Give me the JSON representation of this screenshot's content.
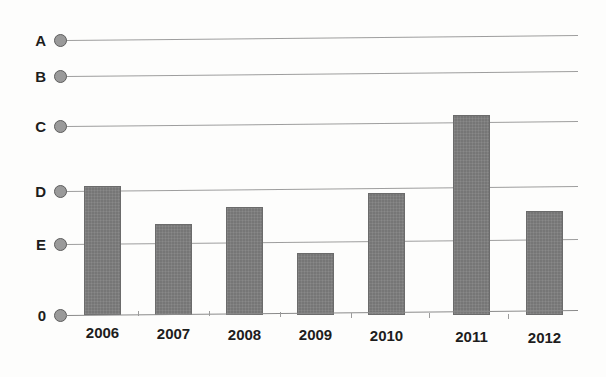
{
  "chart_data": {
    "type": "bar",
    "title": "",
    "subtitle": "",
    "xlabel": "",
    "ylabel": "",
    "grid": true,
    "legend": null,
    "categories": [
      "2006",
      "2007",
      "2008",
      "2009",
      "2010",
      "2011",
      "2012"
    ],
    "values": [
      2.05,
      1.38,
      1.7,
      0.87,
      1.97,
      3.18,
      1.62
    ],
    "ytick_labels": [
      "A",
      "B",
      "C",
      "D",
      "E",
      "0"
    ],
    "ytick_values": [
      5,
      4,
      3,
      2,
      1,
      0
    ],
    "ylim": [
      0,
      5.35
    ],
    "bar_color": "#767676",
    "gridline_color": "#8d8d8d",
    "marker_color": "#9a9a9a",
    "background_color": "#fdfdfc",
    "bars": [
      {
        "category": "2006",
        "value": 2.05,
        "x": 84,
        "top": 186,
        "width": 37
      },
      {
        "category": "2007",
        "value": 1.38,
        "x": 155,
        "top": 224,
        "width": 37
      },
      {
        "category": "2008",
        "value": 1.7,
        "x": 226,
        "top": 207,
        "width": 37
      },
      {
        "category": "2009",
        "value": 0.87,
        "x": 297,
        "top": 253,
        "width": 37
      },
      {
        "category": "2010",
        "value": 1.97,
        "x": 368,
        "top": 193,
        "width": 37
      },
      {
        "category": "2011",
        "value": 3.18,
        "x": 453,
        "top": 115,
        "width": 37
      },
      {
        "category": "2012",
        "value": 1.62,
        "x": 526,
        "top": 211,
        "width": 37
      }
    ],
    "gridlines": [
      {
        "label": "A",
        "y": 40,
        "x_start": 66,
        "x_end": 578
      },
      {
        "label": "B",
        "y": 76,
        "x_start": 66,
        "x_end": 578
      },
      {
        "label": "C",
        "y": 126,
        "x_start": 66,
        "x_end": 578
      },
      {
        "label": "D",
        "y": 191,
        "x_start": 66,
        "x_end": 578
      },
      {
        "label": "E",
        "y": 244,
        "x_start": 66,
        "x_end": 578
      },
      {
        "label": "0",
        "y": 315,
        "x_start": 66,
        "x_end": 578
      }
    ]
  }
}
